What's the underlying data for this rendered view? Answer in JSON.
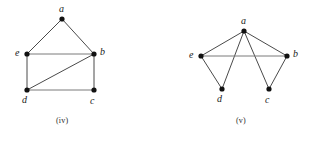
{
  "page": {
    "background_color": "#ffffff",
    "width": 317,
    "height": 141
  },
  "style": {
    "edge_color": "#7a7a7a",
    "edge_dark_color": "#4a4a4a",
    "vertex_color": "#111111",
    "label_color": "#1a1a1a",
    "caption_color": "#2b2b2b",
    "vertex_radius": 2.6
  },
  "figures": [
    {
      "id": "graph-iv",
      "caption": "(iv)",
      "caption_pos": {
        "x": 56,
        "y": 116
      },
      "vertices": [
        {
          "id": "a",
          "label": "a",
          "x": 62,
          "y": 19,
          "label_x": 59,
          "label_y": 4
        },
        {
          "id": "e",
          "label": "e",
          "x": 27,
          "y": 54,
          "label_x": 15,
          "label_y": 48
        },
        {
          "id": "b",
          "label": "b",
          "x": 94,
          "y": 54,
          "label_x": 100,
          "label_y": 47
        },
        {
          "id": "d",
          "label": "d",
          "x": 27,
          "y": 90,
          "label_x": 22,
          "label_y": 95
        },
        {
          "id": "c",
          "label": "c",
          "x": 94,
          "y": 90,
          "label_x": 90,
          "label_y": 96
        }
      ],
      "edges": [
        {
          "from": "a",
          "to": "e",
          "tone": "dark"
        },
        {
          "from": "a",
          "to": "b",
          "tone": "dark"
        },
        {
          "from": "e",
          "to": "b",
          "tone": "light"
        },
        {
          "from": "e",
          "to": "d",
          "tone": "dark"
        },
        {
          "from": "b",
          "to": "c",
          "tone": "dark"
        },
        {
          "from": "d",
          "to": "c",
          "tone": "light"
        },
        {
          "from": "d",
          "to": "b",
          "tone": "dark"
        }
      ]
    },
    {
      "id": "graph-v",
      "caption": "(v)",
      "caption_pos": {
        "x": 78,
        "y": 116
      },
      "vertices": [
        {
          "id": "a",
          "label": "a",
          "x": 86,
          "y": 31,
          "label_x": 83,
          "label_y": 16
        },
        {
          "id": "e",
          "label": "e",
          "x": 43,
          "y": 56,
          "label_x": 31,
          "label_y": 50
        },
        {
          "id": "b",
          "label": "b",
          "x": 129,
          "y": 56,
          "label_x": 135,
          "label_y": 49
        },
        {
          "id": "d",
          "label": "d",
          "x": 64,
          "y": 89,
          "label_x": 59,
          "label_y": 94
        },
        {
          "id": "c",
          "label": "c",
          "x": 111,
          "y": 89,
          "label_x": 107,
          "label_y": 95
        }
      ],
      "edges": [
        {
          "from": "a",
          "to": "e",
          "tone": "dark"
        },
        {
          "from": "a",
          "to": "d",
          "tone": "dark"
        },
        {
          "from": "a",
          "to": "c",
          "tone": "dark"
        },
        {
          "from": "a",
          "to": "b",
          "tone": "dark"
        },
        {
          "from": "e",
          "to": "b",
          "tone": "light"
        },
        {
          "from": "e",
          "to": "d",
          "tone": "dark"
        },
        {
          "from": "b",
          "to": "c",
          "tone": "dark"
        }
      ]
    }
  ]
}
